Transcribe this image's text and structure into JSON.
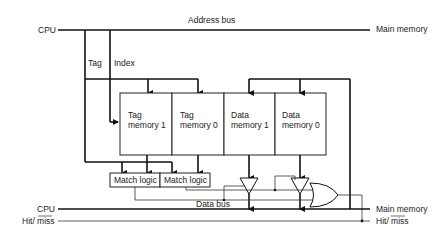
{
  "diagram": {
    "labels": {
      "cpu_top": "CPU",
      "address_bus": "Address bus",
      "main_memory_top": "Main memory",
      "tag": "Tag",
      "index": "Index",
      "cpu_bottom": "CPU",
      "hit_miss_left": "Hit/ miss",
      "data_bus": "Data bus",
      "main_memory_bottom": "Main memory",
      "hit_miss_right": "Hit/ miss"
    },
    "memories": [
      {
        "line1": "Tag",
        "line2": "memory 1"
      },
      {
        "line1": "Tag",
        "line2": "memory 0"
      },
      {
        "line1": "Data",
        "line2": "memory 1"
      },
      {
        "line1": "Data",
        "line2": "memory 0"
      }
    ],
    "match_logic": [
      {
        "label": "Match logic"
      },
      {
        "label": "Match logic"
      }
    ],
    "components": {
      "buffers": [
        "tri-state-buffer-1",
        "tri-state-buffer-0"
      ],
      "gate": "or-gate"
    },
    "colors": {
      "line": "#111111",
      "background": "#ffffff"
    }
  }
}
